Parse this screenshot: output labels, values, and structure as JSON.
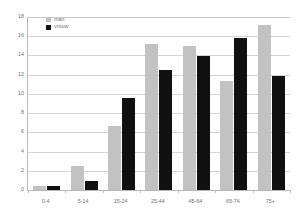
{
  "chart_data": {
    "type": "bar",
    "title": "",
    "subtitle": "",
    "xlabel": "",
    "ylabel": "",
    "categories": [
      "0-4",
      "5-14",
      "15-24",
      "25-44",
      "45-64",
      "65-74",
      "75+"
    ],
    "series": [
      {
        "name": "man",
        "color": "#c2c2c2",
        "values": [
          0.4,
          2.5,
          6.7,
          15.2,
          15.0,
          11.3,
          17.2
        ]
      },
      {
        "name": "vrouw",
        "color": "#101010",
        "values": [
          0.4,
          0.9,
          9.6,
          12.5,
          13.9,
          15.8,
          11.9
        ]
      }
    ],
    "ylim": [
      0,
      18
    ],
    "yticks": [
      0,
      2,
      4,
      6,
      8,
      10,
      12,
      14,
      16,
      18
    ],
    "ytick_labels": [
      "0",
      "2",
      "4",
      "6",
      "8",
      "10",
      "12",
      "14",
      "16",
      "18"
    ],
    "grid": true,
    "grid_axis": "y",
    "legend_position": "top-left"
  },
  "legend": {
    "entries": [
      {
        "label": "man"
      },
      {
        "label": "vrouw"
      }
    ]
  },
  "colors": {
    "series_man": "#c2c2c2",
    "series_vrouw": "#101010",
    "gridline": "#d5d5d5",
    "axis": "#b8b8b8",
    "text": "#737373",
    "background": "#ffffff"
  }
}
